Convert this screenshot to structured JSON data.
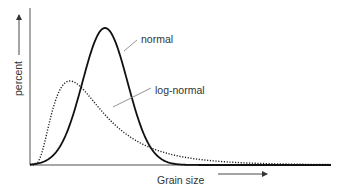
{
  "chart_data": {
    "type": "line",
    "title": "",
    "xlabel": "Grain size",
    "ylabel": "percent",
    "x_ticks": [],
    "y_ticks": [],
    "grid": false,
    "legend": "none (curves labeled directly with leader lines)",
    "annotations": [
      "normal",
      "log-normal"
    ],
    "axis_arrows": {
      "x": "right-pointing arrow after 'Grain size'",
      "y": "up-pointing arrow after 'percent'"
    },
    "series": [
      {
        "name": "normal",
        "style": "solid",
        "color": "#1a1a1a",
        "description": "Symmetric bell curve, narrow and tall",
        "x": [
          0,
          0.1,
          0.2,
          0.25,
          0.3,
          0.35,
          0.4,
          0.45,
          0.5,
          0.6,
          1.0
        ],
        "values": [
          0,
          0.02,
          0.3,
          0.62,
          0.93,
          1.0,
          0.9,
          0.58,
          0.28,
          0.02,
          0
        ]
      },
      {
        "name": "log-normal",
        "style": "dotted",
        "color": "#1a1a1a",
        "description": "Right-skewed curve, lower peak, long tail",
        "x": [
          0,
          0.05,
          0.1,
          0.13,
          0.2,
          0.3,
          0.4,
          0.5,
          0.6,
          0.8,
          1.0
        ],
        "values": [
          0,
          0.35,
          0.55,
          0.61,
          0.55,
          0.38,
          0.22,
          0.13,
          0.08,
          0.03,
          0.01
        ]
      }
    ]
  },
  "labels": {
    "ylabel": "percent",
    "xlabel": "Grain size",
    "normal": "normal",
    "lognormal": "log-normal"
  }
}
